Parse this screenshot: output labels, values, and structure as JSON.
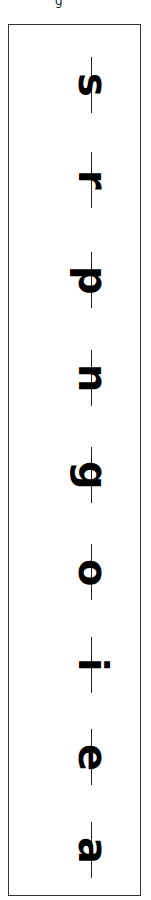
{
  "top_mark": "g",
  "letters": [
    {
      "char": "s",
      "y": 85
    },
    {
      "char": "r",
      "y": 180
    },
    {
      "char": "p",
      "y": 280
    },
    {
      "char": "n",
      "y": 378
    },
    {
      "char": "g",
      "y": 475
    },
    {
      "char": "o",
      "y": 572
    },
    {
      "char": "i",
      "y": 665
    },
    {
      "char": "e",
      "y": 757
    },
    {
      "char": "a",
      "y": 850
    }
  ],
  "colors": {
    "ink": "#000000",
    "frame": "#333333",
    "background": "#ffffff"
  }
}
